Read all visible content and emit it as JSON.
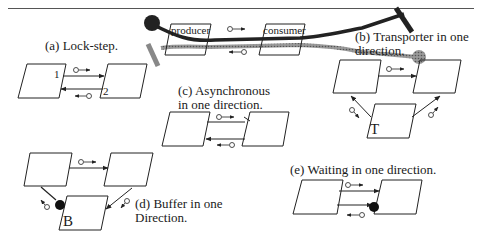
{
  "figure": {
    "top_rule": true,
    "top_illustration": {
      "producer_label": "producer",
      "consumer_label": "consumer"
    },
    "panels": [
      {
        "id": "a",
        "caption": "(a) Lock-step.",
        "markers": [
          "1",
          "2"
        ]
      },
      {
        "id": "b",
        "caption_line1": "(b) Transporter in one",
        "caption_line2": "direction.",
        "node_label": "T"
      },
      {
        "id": "c",
        "caption_line1": "(c) Asynchronous",
        "caption_line2": "in one direction."
      },
      {
        "id": "d",
        "caption_line1": "(d) Buffer in one",
        "caption_line2": "Direction.",
        "node_label": "B"
      },
      {
        "id": "e",
        "caption": "(e) Waiting in one direction."
      }
    ]
  }
}
